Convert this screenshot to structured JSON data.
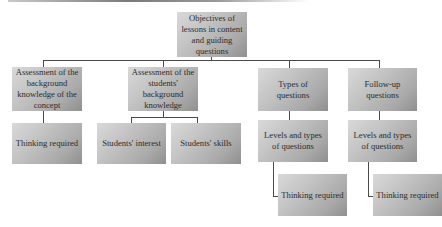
{
  "diagram": {
    "root": {
      "label": "Objectives of lessons in content and guiding questions"
    },
    "branches": [
      {
        "label": "Assessment of the background knowledge of the concept",
        "children": [
          {
            "label": "Thinking required"
          }
        ]
      },
      {
        "label": "Assessment of the students' background knowledge",
        "children": [
          {
            "label": "Students' interest"
          },
          {
            "label": "Students' skills"
          }
        ]
      },
      {
        "label": "Types of questions",
        "children": [
          {
            "label": "Levels and types of questions",
            "children": [
              {
                "label": "Thinking required"
              }
            ]
          }
        ]
      },
      {
        "label": "Follow-up questions",
        "children": [
          {
            "label": "Levels and types of questions",
            "children": [
              {
                "label": "Thinking required"
              }
            ]
          }
        ]
      }
    ]
  }
}
